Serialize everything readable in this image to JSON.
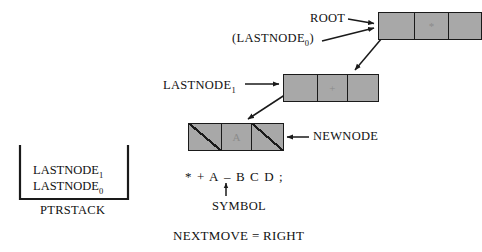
{
  "diagram": {
    "colors": {
      "node_fill": "#a8a8a8",
      "node_stroke": "#1a1a1a",
      "text": "#111111",
      "cell_symbol": "#8b8b8b",
      "background": "#ffffff"
    }
  },
  "nodes": [
    {
      "id": "root",
      "label": "ROOT",
      "alt_label": "(LASTNODE0)",
      "cells": [
        {
          "name": "left-pointer",
          "value": "",
          "null": false
        },
        {
          "name": "data",
          "value": "*",
          "null": false
        },
        {
          "name": "right-pointer",
          "value": "",
          "null": false
        }
      ]
    },
    {
      "id": "lastnode1",
      "label": "LASTNODE1",
      "cells": [
        {
          "name": "left-pointer",
          "value": "",
          "null": false
        },
        {
          "name": "data",
          "value": "+",
          "null": false
        },
        {
          "name": "right-pointer",
          "value": "",
          "null": false
        }
      ]
    },
    {
      "id": "newnode",
      "label": "NEWNODE",
      "cells": [
        {
          "name": "left-pointer",
          "value": "",
          "null": true
        },
        {
          "name": "data",
          "value": "A",
          "null": false
        },
        {
          "name": "right-pointer",
          "value": "",
          "null": true
        }
      ]
    }
  ],
  "labels": {
    "root": "ROOT",
    "lastnode0_paren_prefix": "(LASTNODE",
    "lastnode0_sub": "0",
    "lastnode0_paren_suffix": ")",
    "lastnode1_prefix": "LASTNODE",
    "lastnode1_sub": "1",
    "newnode": "NEWNODE",
    "symbol": "SYMBOL",
    "ptrstack": "PTRSTACK",
    "nextmove": "NEXTMOVE = RIGHT"
  },
  "stack": {
    "name": "PTRSTACK",
    "items": [
      {
        "text_prefix": "LASTNODE",
        "subscript": "1"
      },
      {
        "text_prefix": "LASTNODE",
        "subscript": "0"
      }
    ]
  },
  "expression": {
    "tokens": [
      "*",
      "+",
      "A",
      "–",
      "B",
      "C",
      "D",
      ";"
    ],
    "pointer_index": 3,
    "pointer_label": "SYMBOL"
  }
}
